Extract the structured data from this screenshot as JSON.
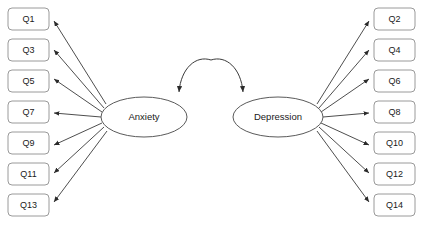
{
  "diagram": {
    "type": "sem-path-diagram",
    "title": "",
    "background_color": "#ffffff",
    "width": 421,
    "height": 230,
    "colors": {
      "box_stroke": "#9a9a9a",
      "box_fill": "#ffffff",
      "ellipse_stroke": "#5a5a5a",
      "ellipse_fill": "#ffffff",
      "arrow_stroke": "#3a3a3a",
      "label_text": "#1a1a1a"
    },
    "latent_variables": [
      {
        "id": "anxiety",
        "label": "Anxiety",
        "cx": 144,
        "cy": 117,
        "rx": 43,
        "ry": 20,
        "side": "left"
      },
      {
        "id": "depression",
        "label": "Depression",
        "cx": 278,
        "cy": 117,
        "rx": 45,
        "ry": 20,
        "side": "right"
      }
    ],
    "left_indicators": [
      {
        "id": "q1",
        "label": "Q1",
        "x": 8,
        "y": 8,
        "w": 41,
        "h": 22
      },
      {
        "id": "q3",
        "label": "Q3",
        "x": 8,
        "y": 39,
        "w": 41,
        "h": 22
      },
      {
        "id": "q5",
        "label": "Q5",
        "x": 8,
        "y": 70,
        "w": 41,
        "h": 22
      },
      {
        "id": "q7",
        "label": "Q7",
        "x": 8,
        "y": 101,
        "w": 41,
        "h": 22
      },
      {
        "id": "q9",
        "label": "Q9",
        "x": 8,
        "y": 132,
        "w": 41,
        "h": 22
      },
      {
        "id": "q11",
        "label": "Q11",
        "x": 8,
        "y": 163,
        "w": 41,
        "h": 22
      },
      {
        "id": "q13",
        "label": "Q13",
        "x": 8,
        "y": 194,
        "w": 41,
        "h": 22
      }
    ],
    "right_indicators": [
      {
        "id": "q2",
        "label": "Q2",
        "x": 374,
        "y": 8,
        "w": 41,
        "h": 22
      },
      {
        "id": "q4",
        "label": "Q4",
        "x": 374,
        "y": 39,
        "w": 41,
        "h": 22
      },
      {
        "id": "q6",
        "label": "Q6",
        "x": 374,
        "y": 70,
        "w": 41,
        "h": 22
      },
      {
        "id": "q8",
        "label": "Q8",
        "x": 374,
        "y": 101,
        "w": 41,
        "h": 22
      },
      {
        "id": "q10",
        "label": "Q10",
        "x": 374,
        "y": 132,
        "w": 41,
        "h": 22
      },
      {
        "id": "q12",
        "label": "Q12",
        "x": 374,
        "y": 163,
        "w": 41,
        "h": 22
      },
      {
        "id": "q14",
        "label": "Q14",
        "x": 374,
        "y": 194,
        "w": 41,
        "h": 22
      }
    ],
    "covariance": {
      "from": "anxiety",
      "to": "depression",
      "label": "",
      "style": "double-headed-curved-arrow"
    }
  }
}
